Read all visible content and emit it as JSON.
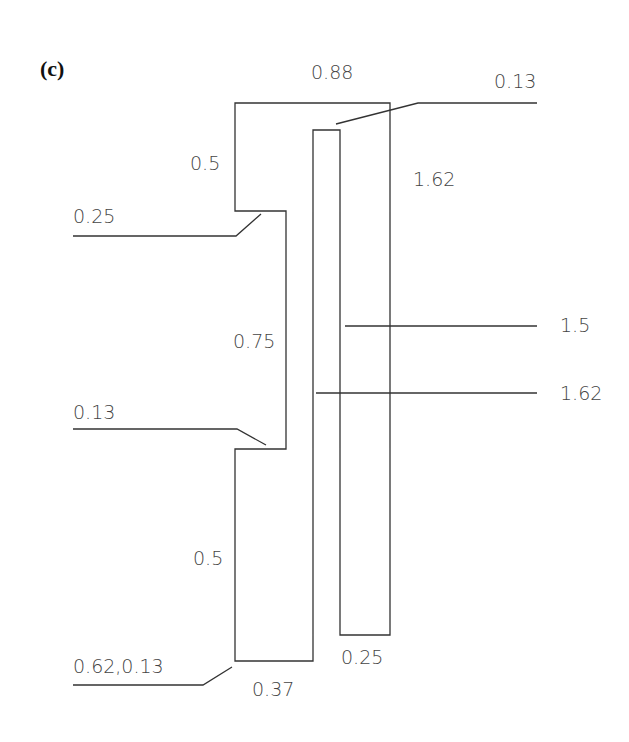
{
  "figure": {
    "panel_label": "(c)",
    "dimensions": {
      "top_width": "0.88",
      "inner_gap_top": "0.13",
      "outer_right_height": "1.62",
      "upper_left_height": "0.5",
      "step_width_upper": "0.25",
      "middle_height": "0.75",
      "step_width_lower": "0.13",
      "lower_left_height": "0.5",
      "bottom_coords": "0.62,0.13",
      "bottom_width": "0.37",
      "strip_bottom_width": "0.25",
      "strip_height": "1.5",
      "inner_slot_height": "1.62"
    }
  }
}
